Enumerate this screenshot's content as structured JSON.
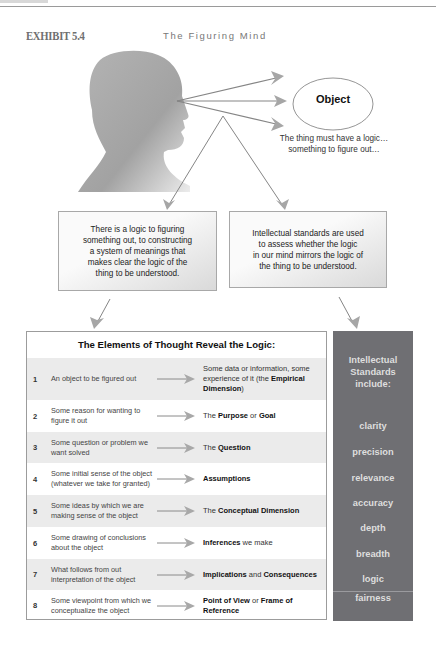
{
  "exhibit": {
    "label": "EXHIBIT 5.4",
    "title": "The Figuring Mind"
  },
  "diagram": {
    "object_label": "Object",
    "caption_line1": "The thing must have a logic…",
    "caption_line2": "something to figure out…",
    "left_box": [
      "There is a logic to figuring",
      "something out, to constructing",
      "a system of meanings that",
      "makes clear the logic of the",
      "thing to be understood."
    ],
    "right_box": [
      "Intellectual standards are used",
      "to assess whether the logic",
      "in our mind mirrors the logic of",
      "the thing to be understood."
    ],
    "colors": {
      "arrow": "#8a8a8a",
      "panel": "#6f6f73",
      "panel_text": "#dedede",
      "row_shade": "#ebebeb",
      "head": "#a9a9a9"
    }
  },
  "table": {
    "header": "The Elements of Thought Reveal the Logic:",
    "rows": [
      {
        "num": "1",
        "left": "An object to be figured out",
        "right_pre": "Some data or information, some experience of it (the ",
        "right_bold": "Empirical Dimension",
        "right_post": ")"
      },
      {
        "num": "2",
        "left": "Some reason for wanting to figure it out",
        "right_pre": "The ",
        "right_bold": "Purpose",
        "right_mid": " or ",
        "right_bold2": "Goal",
        "right_post": ""
      },
      {
        "num": "3",
        "left": "Some question or problem we want solved",
        "right_pre": "The ",
        "right_bold": "Question",
        "right_post": ""
      },
      {
        "num": "4",
        "left": "Some initial sense of the object (whatever we take for granted)",
        "right_pre": "",
        "right_bold": "Assumptions",
        "right_post": ""
      },
      {
        "num": "5",
        "left": "Some ideas by which we are making sense of the object",
        "right_pre": "The ",
        "right_bold": "Conceptual Dimension",
        "right_post": ""
      },
      {
        "num": "6",
        "left": "Some drawing of conclusions about the object",
        "right_pre": "",
        "right_bold": "Inferences",
        "right_post": " we make"
      },
      {
        "num": "7",
        "left": "What follows from out interpretation of the object",
        "right_pre": "",
        "right_bold": "Implications",
        "right_mid": " and ",
        "right_bold2": "Consequences",
        "right_post": ""
      },
      {
        "num": "8",
        "left": "Some viewpoint from which we conceptualize the object",
        "right_pre": "",
        "right_bold": "Point of View",
        "right_mid": " or ",
        "right_bold2": "Frame of Reference",
        "right_post": ""
      }
    ]
  },
  "standards": {
    "heading_line1": "Intellectual",
    "heading_line2": "Standards",
    "heading_line3": "include:",
    "items": [
      "clarity",
      "precision",
      "relevance",
      "accuracy",
      "depth",
      "breadth",
      "logic",
      "fairness"
    ]
  }
}
